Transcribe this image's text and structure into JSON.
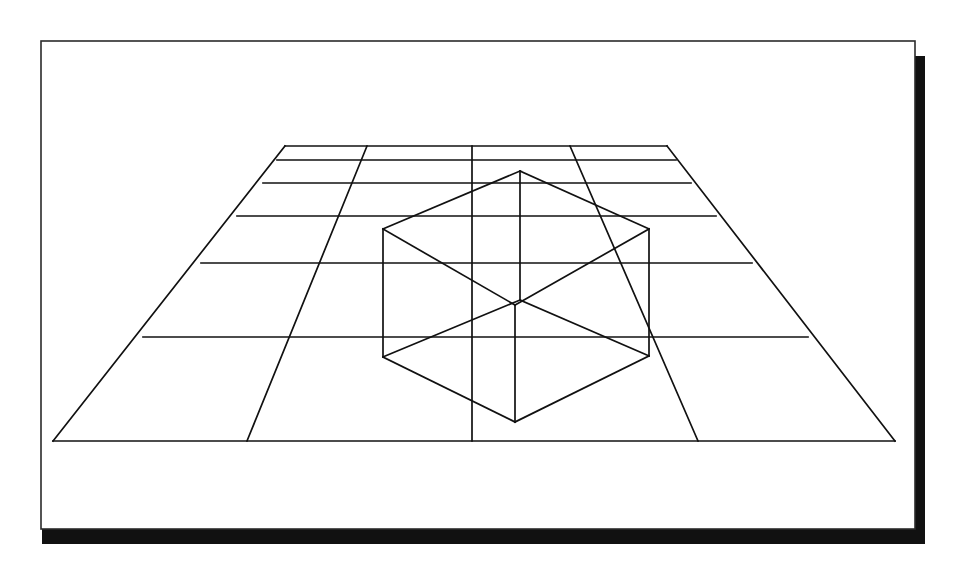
{
  "document": {
    "type": "line-drawing-illustration",
    "title": "Wireframe cube on a perspective grid plane",
    "caption": "",
    "background_color": "#ffffff"
  },
  "card": {
    "name": "paper-card",
    "fill": "#ffffff",
    "border_color": "#2b2b2b",
    "border_width": 1.6,
    "x": 41,
    "y": 41,
    "width": 874,
    "height": 488,
    "shadow_color": "#111111",
    "shadow_offset_x": 10,
    "shadow_offset_y": 15,
    "shadow_thickness": 11
  },
  "drawing": {
    "stroke_color": "#111111",
    "stroke_width": 1.7,
    "fill": "none",
    "grid": {
      "name": "perspective-ground-grid",
      "label": "Receding checkerboard ground plane",
      "rows": 6,
      "columns": 4,
      "outline": [
        [
          285,
          146
        ],
        [
          667,
          146
        ],
        [
          895,
          441
        ],
        [
          53,
          441
        ]
      ],
      "horizontal_lines": [
        {
          "id": "h0",
          "y_left": 146,
          "x_left": 285,
          "x_right": 667,
          "y_right": 146
        },
        {
          "id": "h1",
          "y_left": 160,
          "x_left": 277,
          "x_right": 676,
          "y_right": 160
        },
        {
          "id": "h2",
          "y_left": 183,
          "x_left": 263,
          "x_right": 691,
          "y_right": 183
        },
        {
          "id": "h3",
          "y_left": 216,
          "x_left": 237,
          "x_right": 716,
          "y_right": 216
        },
        {
          "id": "h4",
          "y_left": 263,
          "x_left": 201,
          "x_right": 752,
          "y_right": 263
        },
        {
          "id": "h5",
          "y_left": 337,
          "x_left": 143,
          "x_right": 808,
          "y_right": 337
        },
        {
          "id": "h6",
          "y_left": 441,
          "x_left": 53,
          "x_right": 895,
          "y_right": 441
        }
      ],
      "vertical_lines": [
        {
          "id": "v0",
          "x_top": 285,
          "y_top": 146,
          "x_bottom": 53,
          "y_bottom": 441
        },
        {
          "id": "v1",
          "x_top": 367,
          "y_top": 146,
          "x_bottom": 247,
          "y_bottom": 441
        },
        {
          "id": "v2",
          "x_top": 472,
          "y_top": 146,
          "x_bottom": 472,
          "y_bottom": 441
        },
        {
          "id": "v3",
          "x_top": 570,
          "y_top": 146,
          "x_bottom": 698,
          "y_bottom": 441
        },
        {
          "id": "v4",
          "x_top": 667,
          "y_top": 146,
          "x_bottom": 895,
          "y_bottom": 441
        }
      ]
    },
    "cube": {
      "name": "wireframe-cube",
      "label": "Transparent wireframe cube resting on the grid",
      "projection": "isometric",
      "vertices": {
        "top_back": [
          520,
          171
        ],
        "top_left": [
          383,
          229
        ],
        "top_right": [
          649,
          229
        ],
        "top_front": [
          515,
          305
        ],
        "bottom_left": [
          383,
          357
        ],
        "bottom_right": [
          649,
          356
        ],
        "bottom_front": [
          515,
          422
        ],
        "bottom_back": [
          520,
          300
        ]
      },
      "edges": [
        [
          "top_back",
          "top_left"
        ],
        [
          "top_back",
          "top_right"
        ],
        [
          "top_left",
          "top_front"
        ],
        [
          "top_right",
          "top_front"
        ],
        [
          "top_left",
          "bottom_left"
        ],
        [
          "top_right",
          "bottom_right"
        ],
        [
          "top_front",
          "bottom_front"
        ],
        [
          "bottom_left",
          "bottom_front"
        ],
        [
          "bottom_right",
          "bottom_front"
        ],
        [
          "top_back",
          "bottom_back"
        ],
        [
          "bottom_back",
          "bottom_left"
        ],
        [
          "bottom_back",
          "bottom_right"
        ]
      ]
    }
  }
}
